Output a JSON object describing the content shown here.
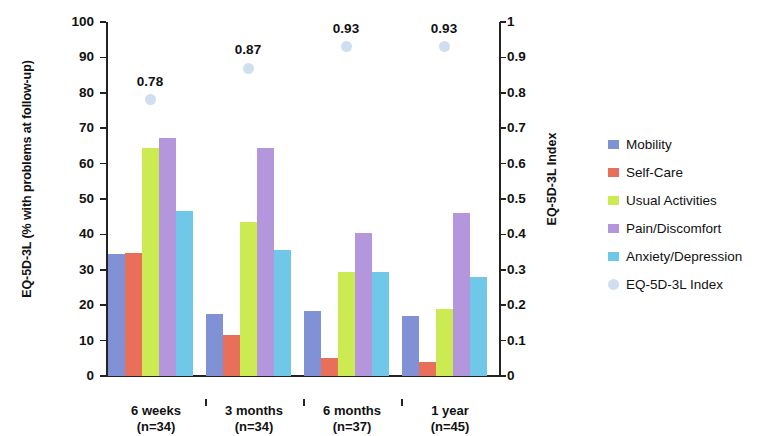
{
  "chart_data": {
    "type": "bar",
    "title": "",
    "xlabel": "",
    "ylabel": "EQ-5D-3L (% with problems at follow-up)",
    "y2label": "EQ-5D-3L Index",
    "ylim": [
      0,
      100
    ],
    "y2lim": [
      0,
      1
    ],
    "grid": false,
    "legend_position": "right",
    "categories": [
      "6 weeks",
      "3 months",
      "6 months",
      "1 year"
    ],
    "category_sublabels": [
      "(n=34)",
      "(n=34)",
      "(n=37)",
      "(n=45)"
    ],
    "y_ticks": [
      "0",
      "10",
      "20",
      "30",
      "40",
      "50",
      "60",
      "70",
      "80",
      "90",
      "100"
    ],
    "y2_ticks": [
      "0",
      "0.1",
      "0.2",
      "0.3",
      "0.4",
      "0.5",
      "0.6",
      "0.7",
      "0.8",
      "0.9",
      "1"
    ],
    "series": [
      {
        "name": "Mobility",
        "color": "#8091d6",
        "axis": "left",
        "values": [
          34.5,
          17.5,
          18.5,
          17.0
        ]
      },
      {
        "name": "Self-Care",
        "color": "#e8705a",
        "axis": "left",
        "values": [
          34.8,
          11.5,
          5.0,
          4.0
        ]
      },
      {
        "name": "Usual Activities",
        "color": "#ccea52",
        "axis": "left",
        "values": [
          64.5,
          43.5,
          29.5,
          19.0
        ]
      },
      {
        "name": "Pain/Discomfort",
        "color": "#b496dd",
        "axis": "left",
        "values": [
          67.2,
          64.5,
          40.5,
          46.0
        ]
      },
      {
        "name": "Anxiety/Depression",
        "color": "#70c8e8",
        "axis": "left",
        "values": [
          46.5,
          35.5,
          29.5,
          28.0
        ]
      },
      {
        "name": "EQ-5D-3L Index",
        "color": "#cfdff0",
        "axis": "right",
        "type": "marker",
        "values": [
          0.78,
          0.87,
          0.93,
          0.93
        ],
        "labels": [
          "0.78",
          "0.87",
          "0.93",
          "0.93"
        ]
      }
    ]
  },
  "legend": {
    "items": [
      {
        "label": "Mobility",
        "color": "#8091d6",
        "shape": "square"
      },
      {
        "label": "Self-Care",
        "color": "#e8705a",
        "shape": "square"
      },
      {
        "label": "Usual Activities",
        "color": "#ccea52",
        "shape": "square"
      },
      {
        "label": "Pain/Discomfort",
        "color": "#b496dd",
        "shape": "square"
      },
      {
        "label": "Anxiety/Depression",
        "color": "#70c8e8",
        "shape": "square"
      },
      {
        "label": "EQ-5D-3L Index",
        "color": "#cfdff0",
        "shape": "circle"
      }
    ]
  }
}
